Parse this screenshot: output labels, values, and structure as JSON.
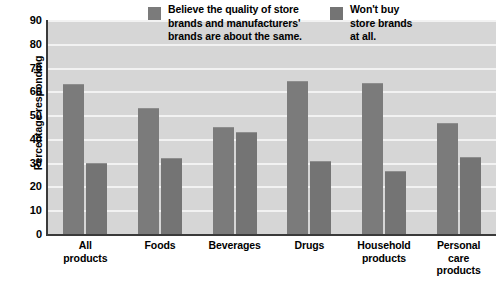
{
  "chart_data": {
    "type": "bar",
    "title": "",
    "xlabel": "",
    "ylabel": "Percentage responding",
    "ylim": [
      0,
      90
    ],
    "ytick_values": [
      90,
      80,
      70,
      60,
      50,
      40,
      30,
      20,
      10,
      0
    ],
    "grid": true,
    "legend_position": "inside-top-center",
    "categories": [
      "All\nproducts",
      "Foods",
      "Beverages",
      "Drugs",
      "Household\nproducts",
      "Personal\ncare\nproducts"
    ],
    "series": [
      {
        "name": "Believe the quality of store\nbrands and manufacturers'\nbrands are about the same.",
        "color": "#7b7b7b",
        "values": [
          63,
          53,
          45,
          64.5,
          63.5,
          46.5
        ]
      },
      {
        "name": "Won't buy\nstore brands\nat all.",
        "color": "#747474",
        "values": [
          30,
          32,
          43,
          30.5,
          26.5,
          32.5
        ]
      }
    ]
  },
  "colors": {
    "plot_background": "#d6d6d6",
    "gridline": "#f2f2f2",
    "axis": "#3a3a3a",
    "series_1": "#7b7b7b",
    "series_2": "#747474",
    "text": "#000000"
  }
}
